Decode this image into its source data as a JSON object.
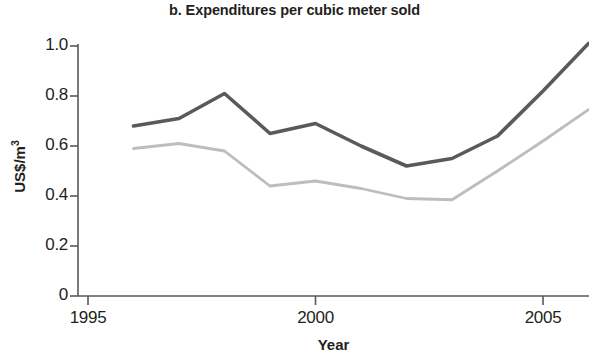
{
  "chart_data": {
    "type": "line",
    "title": "b. Expenditures per cubic meter sold",
    "xlabel": "Year",
    "ylabel": "US$/m3",
    "ylabel_base": "US$/m",
    "ylabel_exponent": "3",
    "x": [
      1996,
      1997,
      1998,
      1999,
      2000,
      2001,
      2002,
      2003,
      2004,
      2005,
      2006
    ],
    "xlim": [
      1995,
      2006
    ],
    "ylim": [
      0,
      1.05
    ],
    "xticks": [
      1995,
      2000,
      2005
    ],
    "xtick_labels": [
      "1995",
      "2000",
      "2005"
    ],
    "yticks": [
      0,
      0.2,
      0.4,
      0.6,
      0.8,
      1.0
    ],
    "ytick_labels": [
      "0",
      "0.2",
      "0.4",
      "0.6",
      "0.8",
      "1.0"
    ],
    "grid": false,
    "legend": "none",
    "series": [
      {
        "name": "upper-series",
        "color": "#5a5a5a",
        "values": [
          0.68,
          0.71,
          0.81,
          0.65,
          0.69,
          0.6,
          0.52,
          0.55,
          0.64,
          0.82,
          1.01
        ]
      },
      {
        "name": "lower-series",
        "color": "#bdbdbd",
        "values": [
          0.59,
          0.61,
          0.58,
          0.44,
          0.46,
          0.43,
          0.39,
          0.385,
          0.5,
          0.62,
          0.745
        ]
      }
    ]
  },
  "axis": {
    "line_color": "#58595b",
    "tick_color": "#58595b"
  }
}
